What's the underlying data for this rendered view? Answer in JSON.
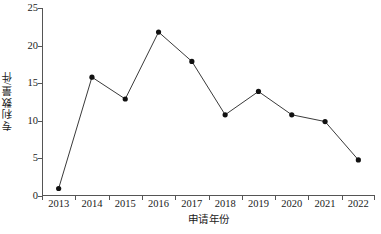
{
  "chart_data": {
    "type": "line",
    "title": "",
    "xlabel": "申请年份",
    "ylabel": "专利数量/件",
    "categories": [
      "2013",
      "2014",
      "2015",
      "2016",
      "2017",
      "2018",
      "2019",
      "2020",
      "2021",
      "2022"
    ],
    "values": [
      1,
      15.8,
      12.9,
      21.8,
      17.9,
      10.8,
      13.9,
      10.8,
      9.9,
      4.8
    ],
    "series": [
      {
        "name": "专利数量",
        "values": [
          1,
          15.8,
          12.9,
          21.8,
          17.9,
          10.8,
          13.9,
          10.8,
          9.9,
          4.8
        ]
      }
    ],
    "ylim": [
      0,
      25
    ],
    "y_ticks": [
      0,
      5,
      10,
      15,
      20,
      25
    ],
    "y_tick_labels": [
      "0",
      "5",
      "10",
      "15",
      "20",
      "25"
    ],
    "grid": false,
    "legend": "none",
    "marker": "filled-circle",
    "line_color": "#3a3a3a",
    "marker_color": "#111111",
    "axis_color": "#555555",
    "background": "#ffffff"
  }
}
